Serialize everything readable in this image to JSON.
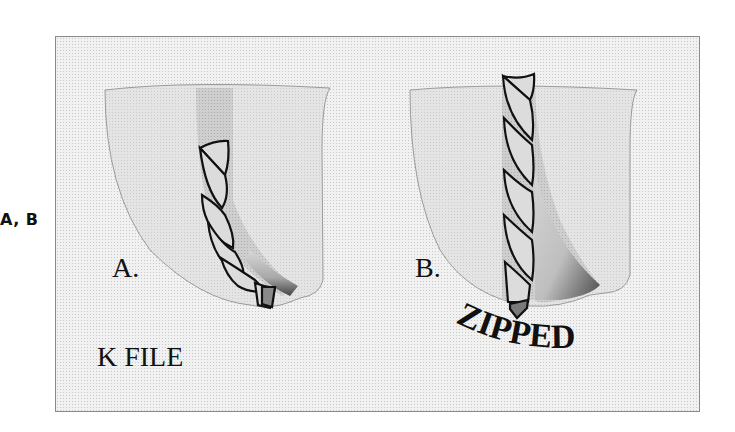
{
  "side_label": "A, B",
  "panels": [
    {
      "id": "A",
      "label": "A.",
      "caption": "K FILE"
    },
    {
      "id": "B",
      "label": "B.",
      "caption": "ZIPPED"
    }
  ],
  "colors": {
    "background": "#f1f1f1",
    "tooth": "#e3e3e3",
    "canal": "#c9c9c9",
    "file": "#dadada",
    "dark_shade": "#555555",
    "outline": "#111111"
  }
}
